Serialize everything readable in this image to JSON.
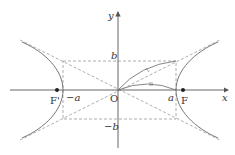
{
  "diagram": {
    "colors": {
      "axis": "#555555",
      "curve": "#777777",
      "dashed": "#999999",
      "text": "#333333",
      "focus": "#222222"
    },
    "labels": {
      "x_axis": "x",
      "y_axis": "y",
      "origin": "O",
      "b": "b",
      "neg_b": "−b",
      "a": "a",
      "neg_a": "−a",
      "focus_right": "F",
      "focus_left": "F'"
    },
    "geometry": {
      "origin": [
        118,
        90
      ],
      "rect": {
        "left": 63,
        "right": 176,
        "top": 61,
        "bottom": 119
      },
      "foci": [
        [
          57,
          90
        ],
        [
          183,
          90
        ]
      ]
    }
  }
}
